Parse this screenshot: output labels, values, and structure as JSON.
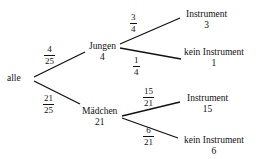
{
  "tree": {
    "root": {
      "label": "alle"
    },
    "level1": [
      {
        "label": "Jungen",
        "count": "4",
        "prob": {
          "num": "4",
          "den": "25"
        }
      },
      {
        "label": "Mädchen",
        "count": "21",
        "prob": {
          "num": "21",
          "den": "25"
        }
      }
    ],
    "level2": [
      {
        "label": "Instrument",
        "count": "3",
        "prob": {
          "num": "3",
          "den": "4"
        }
      },
      {
        "label": "kein Instrument",
        "count": "1",
        "prob": {
          "num": "1",
          "den": "4"
        }
      },
      {
        "label": "Instrument",
        "count": "15",
        "prob": {
          "num": "15",
          "den": "21"
        }
      },
      {
        "label": "kein Instrument",
        "count": "6",
        "prob": {
          "num": "6",
          "den": "21"
        }
      }
    ]
  }
}
